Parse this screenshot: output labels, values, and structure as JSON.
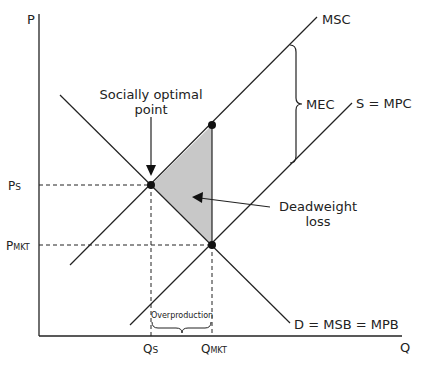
{
  "diagram": {
    "type": "negative-externality-production",
    "axes": {
      "y_label": "P",
      "x_label": "Q"
    },
    "curves": {
      "msc": "MSC",
      "mpc": "S = MPC",
      "demand": "D = MSB = MPB"
    },
    "price_labels": {
      "ps_main": "P",
      "ps_sub": "S",
      "pmkt_main": "P",
      "pmkt_sub": "MKT"
    },
    "quantity_labels": {
      "qs_main": "Q",
      "qs_sub": "S",
      "qmkt_main": "Q",
      "qmkt_sub": "MKT"
    },
    "annotations": {
      "socially_optimal_line1": "Socially optimal",
      "socially_optimal_line2": "point",
      "deadweight_line1": "Deadweight",
      "deadweight_line2": "loss",
      "mec": "MEC",
      "overproduction": "Overproduction"
    },
    "colors": {
      "line": "#222222",
      "shade": "#c8c8c8"
    }
  }
}
